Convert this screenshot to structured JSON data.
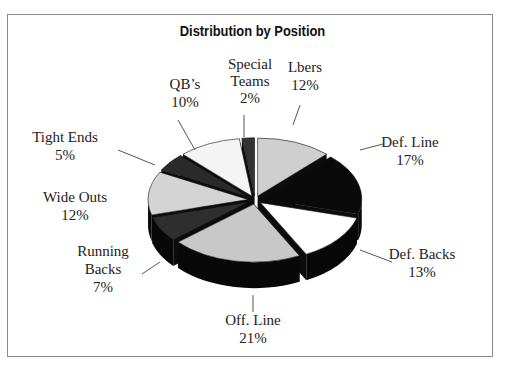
{
  "chart_data": {
    "type": "pie",
    "style": "3d-exploded",
    "title": "Distribution by Position",
    "categories": [
      "Lbers",
      "Def. Line",
      "Def. Backs",
      "Off. Line",
      "Running Backs",
      "Wide Outs",
      "Tight Ends",
      "QB's",
      "Special Teams"
    ],
    "values": [
      12,
      17,
      13,
      21,
      7,
      12,
      5,
      10,
      2
    ],
    "unit": "%",
    "colors": [
      "#cfcfcf",
      "#0a0a0a",
      "#ffffff",
      "#c8c8c8",
      "#2e2e2e",
      "#d4d4d4",
      "#2a2a2a",
      "#f4f4f4",
      "#333333"
    ],
    "legend": "none (data labels with leader lines)"
  },
  "title": "Distribution by Position",
  "labels": [
    {
      "name": "Lbers",
      "pct": "12%"
    },
    {
      "name": "Def. Line",
      "pct": "17%"
    },
    {
      "name": "Def. Backs",
      "pct": "13%"
    },
    {
      "name": "Off. Line",
      "pct": "21%"
    },
    {
      "name1": "Running",
      "name2": "Backs",
      "pct": "7%"
    },
    {
      "name": "Wide Outs",
      "pct": "12%"
    },
    {
      "name": "Tight Ends",
      "pct": "5%"
    },
    {
      "name": "QB’s",
      "pct": "10%"
    },
    {
      "name1": "Special",
      "name2": "Teams",
      "pct": "2%"
    }
  ]
}
